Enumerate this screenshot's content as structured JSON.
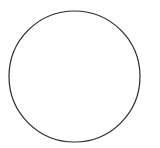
{
  "canvas": {
    "width": 160,
    "height": 148,
    "background": "#ffffff"
  },
  "shape": {
    "type": "circle",
    "cx": 74.5,
    "cy": 76.5,
    "r": 65.5,
    "stroke": "#2a2a2a",
    "stroke_width": 1.2,
    "fill": "none"
  }
}
